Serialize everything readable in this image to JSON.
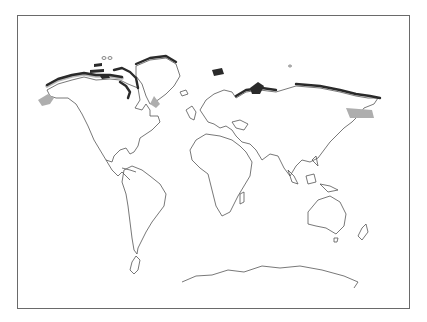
{
  "map": {
    "type": "world-outline",
    "projection": "equirectangular-like",
    "labels": [],
    "highlighted_regions": [
      "arctic-coast-alaska",
      "canadian-arctic-archipelago",
      "greenland-north-coast",
      "svalbard",
      "novaya-zemlya",
      "siberian-arctic-coast",
      "kamchatka-sea-of-okhotsk-shading",
      "bering-sea-shading"
    ],
    "colors": {
      "background": "#ffffff",
      "frame": "#6a6a6a",
      "coastline": "#555555",
      "arctic_highlight": "#2a2a2a",
      "shaded_area": "#aeaeae"
    }
  }
}
